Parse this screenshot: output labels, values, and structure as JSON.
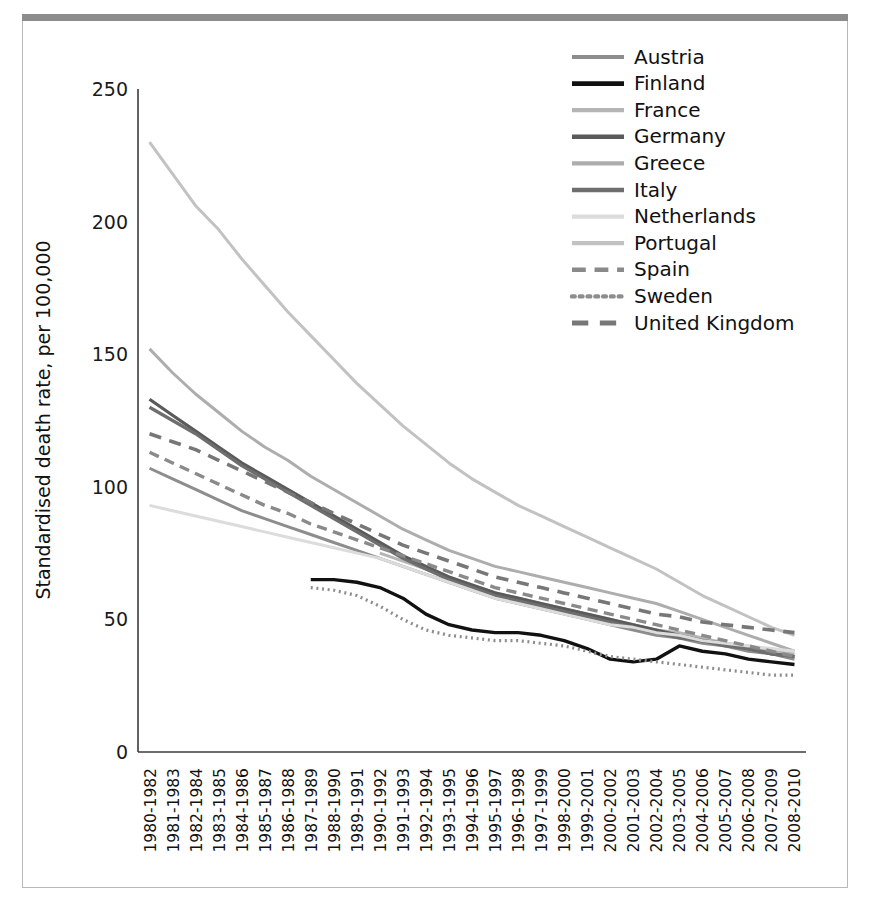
{
  "chart_data": {
    "type": "line",
    "title": "",
    "xlabel": "",
    "ylabel": "Standardised death rate, per 100,000",
    "ylim": [
      0,
      250
    ],
    "yticks": [
      0,
      50,
      100,
      150,
      200,
      250
    ],
    "grid": false,
    "legend_position": "top-right",
    "categories": [
      "1980-1982",
      "1981-1983",
      "1982-1984",
      "1983-1985",
      "1984-1986",
      "1985-1987",
      "1986-1988",
      "1987-1989",
      "1988-1990",
      "1989-1991",
      "1990-1992",
      "1991-1993",
      "1992-1994",
      "1993-1995",
      "1994-1996",
      "1995-1997",
      "1996-1998",
      "1997-1999",
      "1998-2000",
      "1999-2001",
      "2000-2002",
      "2001-2003",
      "2002-2004",
      "2003-2005",
      "2004-2006",
      "2005-2007",
      "2006-2008",
      "2007-2009",
      "2008-2010"
    ],
    "series": [
      {
        "name": "Austria",
        "color": "#8d8d8d",
        "dash": "none",
        "width": 3.0,
        "values": [
          107,
          103,
          99,
          95,
          91,
          88,
          85,
          82,
          79,
          76,
          73,
          70,
          67,
          64,
          61,
          58,
          56,
          54,
          52,
          50,
          48,
          46,
          44,
          43,
          41,
          40,
          38,
          37,
          35
        ]
      },
      {
        "name": "Finland",
        "color": "#111111",
        "dash": "none",
        "width": 3.4,
        "values": [
          null,
          null,
          null,
          null,
          null,
          null,
          null,
          65,
          65,
          64,
          62,
          58,
          52,
          48,
          46,
          45,
          45,
          44,
          42,
          39,
          35,
          34,
          35,
          40,
          38,
          37,
          35,
          34,
          33
        ]
      },
      {
        "name": "France",
        "color": "#b5b5b5",
        "dash": "none",
        "width": 3.0,
        "values": [
          null,
          null,
          null,
          null,
          null,
          null,
          null,
          null,
          null,
          null,
          75,
          72,
          69,
          66,
          63,
          60,
          58,
          56,
          54,
          52,
          50,
          48,
          46,
          45,
          43,
          41,
          40,
          38,
          37
        ]
      },
      {
        "name": "Germany",
        "color": "#5a5a5a",
        "dash": "none",
        "width": 3.2,
        "values": [
          133,
          127,
          121,
          115,
          109,
          104,
          99,
          94,
          89,
          84,
          79,
          74,
          70,
          66,
          63,
          60,
          58,
          56,
          54,
          52,
          50,
          48,
          46,
          44,
          42,
          41,
          39,
          37,
          36
        ]
      },
      {
        "name": "Greece",
        "color": "#adadad",
        "dash": "none",
        "width": 3.0,
        "values": [
          152,
          143,
          135,
          128,
          121,
          115,
          110,
          104,
          99,
          94,
          89,
          84,
          80,
          76,
          73,
          70,
          68,
          66,
          64,
          62,
          60,
          58,
          56,
          53,
          50,
          47,
          44,
          41,
          38
        ]
      },
      {
        "name": "Italy",
        "color": "#6e6e6e",
        "dash": "none",
        "width": 3.2,
        "values": [
          130,
          125,
          120,
          114,
          108,
          103,
          98,
          93,
          88,
          83,
          78,
          73,
          69,
          65,
          62,
          59,
          57,
          55,
          53,
          51,
          49,
          47,
          45,
          43,
          42,
          40,
          39,
          37,
          36
        ]
      },
      {
        "name": "Netherlands",
        "color": "#dcdcdc",
        "dash": "none",
        "width": 3.0,
        "values": [
          93,
          91,
          89,
          87,
          85,
          83,
          81,
          79,
          77,
          75,
          73,
          70,
          67,
          64,
          61,
          58,
          56,
          54,
          52,
          50,
          48,
          47,
          45,
          44,
          42,
          41,
          40,
          39,
          38
        ]
      },
      {
        "name": "Portugal",
        "color": "#c2c2c2",
        "dash": "none",
        "width": 3.0,
        "values": [
          230,
          218,
          206,
          197,
          186,
          176,
          166,
          157,
          148,
          139,
          131,
          123,
          116,
          109,
          103,
          98,
          93,
          89,
          85,
          81,
          77,
          73,
          69,
          64,
          59,
          55,
          51,
          47,
          44
        ]
      },
      {
        "name": "Spain",
        "color": "#8a8a8a",
        "dash": "dashed",
        "width": 3.4,
        "values": [
          113,
          109,
          105,
          101,
          97,
          93,
          90,
          86,
          83,
          80,
          77,
          74,
          71,
          68,
          65,
          62,
          60,
          58,
          56,
          54,
          52,
          50,
          48,
          46,
          44,
          42,
          40,
          38,
          36
        ]
      },
      {
        "name": "Sweden",
        "color": "#8d8d8d",
        "dash": "dotted",
        "width": 3.2,
        "values": [
          null,
          null,
          null,
          null,
          null,
          null,
          null,
          62,
          61,
          59,
          55,
          50,
          46,
          44,
          43,
          42,
          42,
          41,
          40,
          38,
          36,
          35,
          34,
          33,
          32,
          31,
          30,
          29,
          29
        ]
      },
      {
        "name": "United Kingdom",
        "color": "#777777",
        "dash": "dashed-long",
        "width": 3.6,
        "values": [
          120,
          117,
          114,
          110,
          106,
          102,
          98,
          94,
          90,
          86,
          82,
          78,
          75,
          72,
          69,
          66,
          64,
          62,
          60,
          58,
          56,
          54,
          52,
          51,
          49,
          48,
          47,
          46,
          45
        ]
      }
    ]
  },
  "legend": {
    "entries": [
      {
        "label": "Austria"
      },
      {
        "label": "Finland"
      },
      {
        "label": "France"
      },
      {
        "label": "Germany"
      },
      {
        "label": "Greece"
      },
      {
        "label": "Italy"
      },
      {
        "label": "Netherlands"
      },
      {
        "label": "Portugal"
      },
      {
        "label": "Spain"
      },
      {
        "label": "Sweden"
      },
      {
        "label": "United Kingdom"
      }
    ]
  },
  "colors": {
    "frame": "#b9b9b9",
    "top_rule": "#8c8c8c",
    "axis": "#3c3c3c",
    "text": "#111111",
    "background": "#ffffff"
  }
}
